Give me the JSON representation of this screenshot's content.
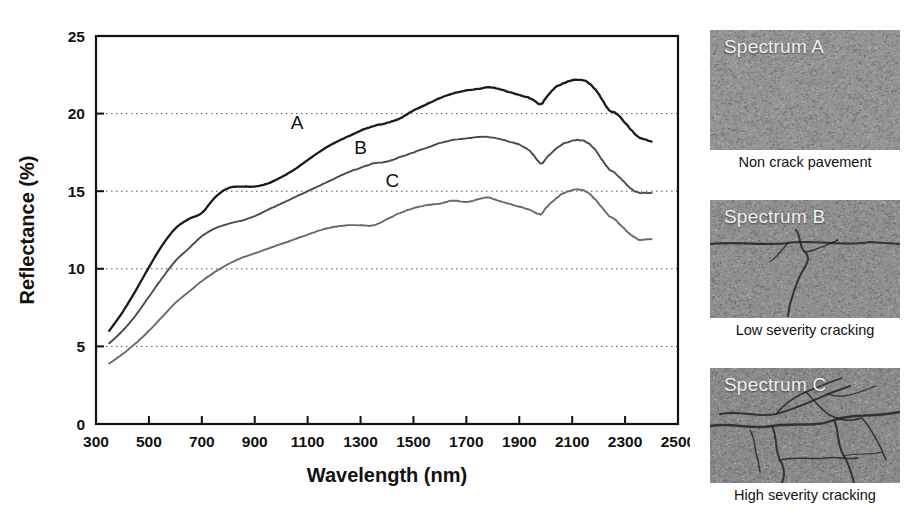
{
  "chart_data": {
    "type": "line",
    "title": "",
    "xlabel": "Wavelength (nm)",
    "ylabel": "Reflectance (%)",
    "xlim": [
      300,
      2500
    ],
    "ylim": [
      0,
      25
    ],
    "xticks": [
      300,
      500,
      700,
      900,
      1100,
      1300,
      1500,
      1700,
      1900,
      2100,
      2300,
      2500
    ],
    "yticks": [
      0,
      5,
      10,
      15,
      20,
      25
    ],
    "xtick_labels": [
      "300",
      "500",
      "700",
      "900",
      "1100",
      "1300",
      "1500",
      "1700",
      "1900",
      "2100",
      "2300",
      "2500"
    ],
    "ytick_labels": [
      "0",
      "5",
      "10",
      "15",
      "20",
      "25"
    ],
    "grid": "horizontal dotted at 5, 10, 15, 20",
    "legend": "inline curve labels A, B, C",
    "annotations": [
      {
        "text": "A",
        "x": 1060,
        "y": 19.0
      },
      {
        "text": "B",
        "x": 1300,
        "y": 17.4
      },
      {
        "text": "C",
        "x": 1420,
        "y": 15.3
      }
    ],
    "series": [
      {
        "name": "A",
        "label": "A",
        "color": "#1a1a1a",
        "width": 2.3,
        "x": [
          350,
          400,
          450,
          500,
          550,
          600,
          650,
          700,
          750,
          800,
          850,
          900,
          950,
          1000,
          1050,
          1100,
          1150,
          1200,
          1250,
          1300,
          1350,
          1400,
          1450,
          1500,
          1550,
          1600,
          1650,
          1700,
          1750,
          1780,
          1820,
          1860,
          1900,
          1940,
          1980,
          2000,
          2030,
          2060,
          2090,
          2120,
          2150,
          2180,
          2210,
          2240,
          2260,
          2290,
          2320,
          2350,
          2380,
          2400
        ],
        "y": [
          6.0,
          7.2,
          8.6,
          10.1,
          11.5,
          12.6,
          13.2,
          13.6,
          14.6,
          15.2,
          15.3,
          15.3,
          15.5,
          15.9,
          16.4,
          17.0,
          17.6,
          18.1,
          18.5,
          18.9,
          19.2,
          19.4,
          19.7,
          20.2,
          20.6,
          21.0,
          21.3,
          21.5,
          21.6,
          21.7,
          21.6,
          21.4,
          21.2,
          21.0,
          20.6,
          21.0,
          21.6,
          21.9,
          22.1,
          22.2,
          22.1,
          21.7,
          21.0,
          20.2,
          20.1,
          19.6,
          19.0,
          18.5,
          18.3,
          18.2
        ]
      },
      {
        "name": "B",
        "label": "B",
        "color": "#4a4a4a",
        "width": 1.9,
        "x": [
          350,
          400,
          450,
          500,
          550,
          600,
          650,
          700,
          750,
          800,
          850,
          900,
          950,
          1000,
          1050,
          1100,
          1150,
          1200,
          1250,
          1300,
          1350,
          1400,
          1450,
          1500,
          1550,
          1600,
          1650,
          1700,
          1750,
          1780,
          1820,
          1860,
          1900,
          1940,
          1980,
          2000,
          2030,
          2060,
          2090,
          2120,
          2150,
          2180,
          2210,
          2240,
          2260,
          2290,
          2320,
          2350,
          2380,
          2400
        ],
        "y": [
          5.2,
          6.0,
          7.0,
          8.2,
          9.4,
          10.5,
          11.3,
          12.1,
          12.6,
          12.9,
          13.1,
          13.4,
          13.8,
          14.2,
          14.6,
          15.0,
          15.4,
          15.8,
          16.2,
          16.5,
          16.8,
          16.9,
          17.2,
          17.5,
          17.8,
          18.1,
          18.3,
          18.4,
          18.5,
          18.5,
          18.4,
          18.2,
          18.0,
          17.6,
          16.8,
          17.1,
          17.6,
          18.0,
          18.2,
          18.3,
          18.2,
          17.8,
          17.1,
          16.4,
          16.2,
          15.7,
          15.2,
          14.9,
          14.9,
          14.9
        ]
      },
      {
        "name": "C",
        "label": "C",
        "color": "#6a6a6a",
        "width": 1.9,
        "x": [
          350,
          400,
          450,
          500,
          550,
          600,
          650,
          700,
          750,
          800,
          850,
          900,
          950,
          1000,
          1050,
          1100,
          1150,
          1200,
          1250,
          1300,
          1350,
          1400,
          1450,
          1500,
          1550,
          1600,
          1650,
          1700,
          1750,
          1780,
          1820,
          1860,
          1900,
          1940,
          1980,
          2000,
          2030,
          2060,
          2090,
          2120,
          2150,
          2180,
          2210,
          2240,
          2260,
          2290,
          2320,
          2350,
          2380,
          2400
        ],
        "y": [
          3.9,
          4.5,
          5.2,
          6.0,
          6.9,
          7.8,
          8.5,
          9.2,
          9.8,
          10.3,
          10.7,
          11.0,
          11.3,
          11.6,
          11.9,
          12.2,
          12.5,
          12.7,
          12.8,
          12.8,
          12.8,
          13.2,
          13.6,
          13.9,
          14.1,
          14.2,
          14.4,
          14.3,
          14.5,
          14.6,
          14.4,
          14.2,
          14.0,
          13.8,
          13.5,
          13.9,
          14.4,
          14.8,
          15.0,
          15.1,
          15.0,
          14.6,
          14.0,
          13.4,
          13.2,
          12.7,
          12.2,
          11.9,
          11.9,
          11.9
        ]
      }
    ]
  },
  "panels": [
    {
      "id": "a",
      "tag": "Spectrum A",
      "caption": "Non crack pavement",
      "texture": "uniform asphalt grain, no cracks"
    },
    {
      "id": "b",
      "tag": "Spectrum B",
      "caption": "Low severity cracking",
      "texture": "single horizontal crack with short branching crack"
    },
    {
      "id": "c",
      "tag": "Spectrum C",
      "caption": "High severity cracking",
      "texture": "dense interconnected alligator cracking network"
    }
  ]
}
